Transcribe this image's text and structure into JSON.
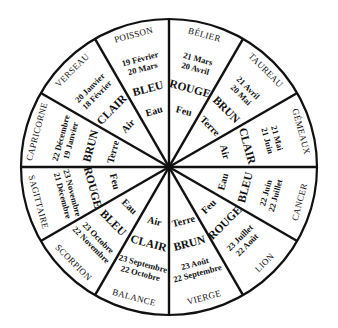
{
  "diagram": {
    "center": [
      169,
      167
    ],
    "radius": 148,
    "segments": [
      {
        "sign": "BÉLIER",
        "dates": [
          "21 Mars",
          "20 Avril"
        ],
        "color": "ROUGE",
        "element": "Feu"
      },
      {
        "sign": "TAUREAU",
        "dates": [
          "21 Avril",
          "20 Mai"
        ],
        "color": "BRUN",
        "element": "Terre"
      },
      {
        "sign": "GÉMEAUX",
        "dates": [
          "21 Mai",
          "21 Juin"
        ],
        "color": "CLAIR",
        "element": "Air"
      },
      {
        "sign": "CANCER",
        "dates": [
          "22 Juin",
          "22 Juillet"
        ],
        "color": "BLEU",
        "element": "Eau"
      },
      {
        "sign": "LION",
        "dates": [
          "23 Juillet",
          "22 Août"
        ],
        "color": "ROUGE",
        "element": "Feu"
      },
      {
        "sign": "VIERGE",
        "dates": [
          "23 Août",
          "22 Septembre"
        ],
        "color": "BRUN",
        "element": "Terre"
      },
      {
        "sign": "BALANCE",
        "dates": [
          "23 Septembre",
          "22 Octobre"
        ],
        "color": "CLAIR",
        "element": "Air"
      },
      {
        "sign": "SCORPION",
        "dates": [
          "23 Octobre",
          "22 Novembre"
        ],
        "color": "BLEU",
        "element": "Eau"
      },
      {
        "sign": "SAGITTAIRE",
        "dates": [
          "23 Novembre",
          "21 Décembre"
        ],
        "color": "ROUGE",
        "element": "Feu"
      },
      {
        "sign": "CAPRICORNE",
        "dates": [
          "22 Décembre",
          "19 Janvier"
        ],
        "color": "BRUN",
        "element": "Terre"
      },
      {
        "sign": "VERSEAU",
        "dates": [
          "20 Janvier",
          "18 Février"
        ],
        "color": "CLAIR",
        "element": "Air"
      },
      {
        "sign": "POISSON",
        "dates": [
          "19 Février",
          "20 Mars"
        ],
        "color": "BLEU",
        "element": "Eau"
      }
    ]
  }
}
